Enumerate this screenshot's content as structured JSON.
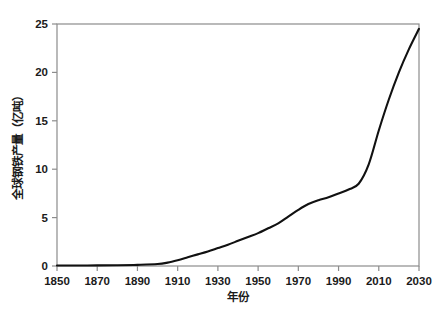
{
  "chart_data": {
    "type": "line",
    "title": "",
    "xlabel": "年份",
    "ylabel": "全球钢铁产量（亿吨）",
    "xlim": [
      1850,
      2030
    ],
    "ylim": [
      0,
      25
    ],
    "grid": false,
    "legend": false,
    "line_color": "#111111",
    "axis_color": "#8c8c8c",
    "background_color": "#ffffff",
    "xticks": [
      1850,
      1870,
      1890,
      1910,
      1930,
      1950,
      1970,
      1990,
      2010,
      2030
    ],
    "xtick_labels": [
      "1850",
      "1870",
      "1890",
      "1910",
      "1930",
      "1950",
      "1970",
      "1990",
      "2010",
      "2030"
    ],
    "yticks": [
      0,
      5,
      10,
      15,
      20,
      25
    ],
    "ytick_labels": [
      "0",
      "5",
      "10",
      "15",
      "20",
      "25"
    ],
    "series": [
      {
        "name": "全球钢铁产量",
        "x": [
          1850,
          1860,
          1870,
          1880,
          1890,
          1900,
          1905,
          1910,
          1915,
          1920,
          1925,
          1930,
          1935,
          1940,
          1945,
          1950,
          1955,
          1960,
          1965,
          1970,
          1975,
          1980,
          1985,
          1990,
          1995,
          2000,
          2005,
          2010,
          2015,
          2020,
          2025,
          2030
        ],
        "y": [
          0.05,
          0.05,
          0.06,
          0.08,
          0.12,
          0.2,
          0.35,
          0.6,
          0.9,
          1.2,
          1.5,
          1.85,
          2.2,
          2.6,
          3.0,
          3.4,
          3.9,
          4.4,
          5.1,
          5.8,
          6.4,
          6.8,
          7.1,
          7.5,
          7.9,
          8.5,
          10.5,
          14.0,
          17.2,
          20.0,
          22.4,
          24.5
        ]
      }
    ]
  },
  "axes": {
    "x_axis_name": "年份",
    "y_axis_name": "全球钢铁产量（亿吨）"
  }
}
